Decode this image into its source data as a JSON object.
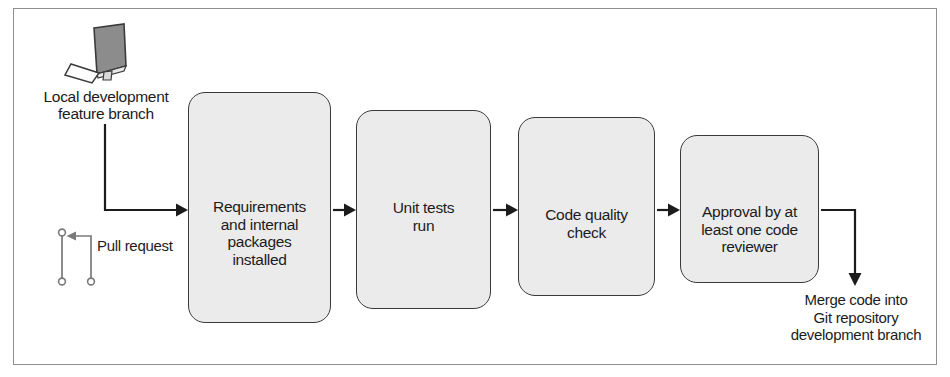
{
  "diagram": {
    "source_label": {
      "name": "local-development-feature-branch",
      "text": "Local development\nfeature branch",
      "icon": "desktop-monitor-icon"
    },
    "pull_request": {
      "name": "pull-request",
      "text": "Pull request",
      "icon": "git-merge-icon"
    },
    "steps": [
      {
        "id": "requirements-installed",
        "icon": "application-window-icon",
        "label": "Requirements\nand internal\npackages\ninstalled"
      },
      {
        "id": "unit-tests-run",
        "icon": "gears-icon",
        "label": "Unit tests\nrun"
      },
      {
        "id": "code-quality-check",
        "icon": "checkmark-icon",
        "label": "Code quality\ncheck"
      },
      {
        "id": "code-reviewer-approval",
        "icon": "person-icon",
        "label": "Approval by at\nleast one code\nreviewer"
      }
    ],
    "outcome": {
      "name": "merge-code-outcome",
      "text": "Merge code into\nGit repository\ndevelopment branch"
    },
    "colors": {
      "box_fill": "#ebebeb",
      "box_stroke": "#3a3a3a",
      "text": "#1c1c1c",
      "connector": "#1c1c1c",
      "frame": "#8e8e8e",
      "git_icon": "#7a7a7a",
      "background": "#ffffff"
    }
  }
}
